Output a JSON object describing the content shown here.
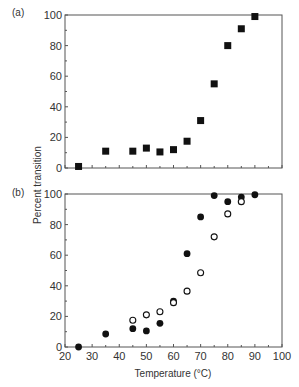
{
  "chart_data": [
    {
      "panel": "(a)",
      "type": "scatter",
      "title": "",
      "xlabel": "",
      "ylabel": "Percent transition",
      "xlim": [
        20,
        100
      ],
      "ylim": [
        0,
        100
      ],
      "xticks": [
        20,
        30,
        40,
        50,
        60,
        70,
        80,
        90,
        100
      ],
      "xtick_labels_shown": false,
      "yticks": [
        0,
        20,
        40,
        60,
        80,
        100
      ],
      "grid": false,
      "series": [
        {
          "name": "filled squares",
          "marker": "square-filled",
          "x": [
            25,
            35,
            45,
            50,
            55,
            60,
            65,
            70,
            75,
            80,
            85,
            90
          ],
          "y": [
            1,
            11,
            11,
            13,
            10.5,
            12,
            17.5,
            31,
            55,
            80,
            91,
            99
          ]
        }
      ]
    },
    {
      "panel": "(b)",
      "type": "scatter",
      "title": "",
      "xlabel": "Temperature (°C)",
      "ylabel": "Percent transition",
      "xlim": [
        20,
        100
      ],
      "ylim": [
        0,
        100
      ],
      "xticks": [
        20,
        30,
        40,
        50,
        60,
        70,
        80,
        90,
        100
      ],
      "yticks": [
        0,
        20,
        40,
        60,
        80,
        100
      ],
      "grid": false,
      "series": [
        {
          "name": "filled circles",
          "marker": "circle-filled",
          "x": [
            25,
            35,
            45,
            50,
            55,
            60,
            65,
            70,
            75,
            80,
            85,
            90
          ],
          "y": [
            0,
            8.5,
            12,
            10.5,
            15.5,
            30,
            61,
            85,
            99,
            95,
            98,
            99.5
          ]
        },
        {
          "name": "open circles",
          "marker": "circle-open",
          "x": [
            45,
            50,
            55,
            60,
            65,
            70,
            75,
            80,
            85
          ],
          "y": [
            17.5,
            21,
            23,
            29,
            36.5,
            48.5,
            72,
            87,
            95
          ]
        }
      ]
    }
  ],
  "labels": {
    "panel_a": "(a)",
    "panel_b": "(b)",
    "ylabel": "Percent transition",
    "xlabel": "Temperature (°C)"
  }
}
